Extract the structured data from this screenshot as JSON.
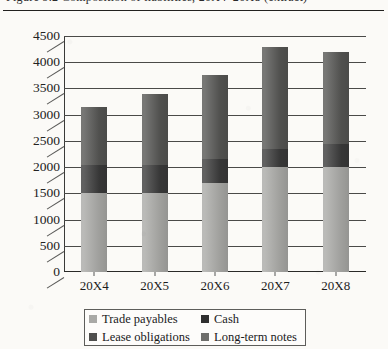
{
  "page": {
    "clipped_caption": "Figure 9.2  Composition of liabilities, 20X4–20X8 (extract)"
  },
  "chart_data": {
    "type": "bar",
    "stacked": true,
    "title": "",
    "xlabel": "",
    "ylabel": "",
    "categories": [
      "20X4",
      "20X5",
      "20X6",
      "20X7",
      "20X8"
    ],
    "ylim": [
      0,
      4500
    ],
    "ytick_step": 500,
    "yticks": [
      0,
      500,
      1000,
      1500,
      2000,
      2500,
      3000,
      3500,
      4000,
      4500
    ],
    "grid": true,
    "legend_position": "bottom",
    "series": [
      {
        "name": "Trade payables",
        "color": "#a9a9a6",
        "values": [
          1500,
          1500,
          1700,
          2000,
          2000
        ]
      },
      {
        "name": "Cash",
        "color": "#3a3a3a",
        "values": [
          550,
          550,
          450,
          350,
          450
        ]
      },
      {
        "name": "Lease obligations",
        "color": "#555553",
        "values": [
          1100,
          1350,
          1600,
          1950,
          1750
        ]
      },
      {
        "name": "Long-term notes",
        "color": "#6e6e6b",
        "values": [
          0,
          0,
          0,
          0,
          0
        ]
      }
    ],
    "totals": [
      3150,
      3400,
      3750,
      4300,
      4200
    ]
  },
  "legend": {
    "entries": [
      {
        "label": "Trade payables",
        "color": "#a9a9a6"
      },
      {
        "label": "Cash",
        "color": "#2f2f2f"
      },
      {
        "label": "Lease obligations",
        "color": "#4e4e4c"
      },
      {
        "label": "Long-term notes",
        "color": "#6e6e6b"
      }
    ]
  }
}
